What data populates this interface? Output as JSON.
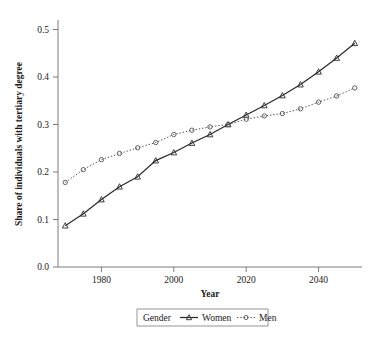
{
  "chart_data": {
    "type": "line",
    "title": "",
    "xlabel": "Year",
    "ylabel": "Share of individuals with tertiary degree",
    "xlim": [
      1968,
      2052
    ],
    "ylim": [
      0.0,
      0.52
    ],
    "xticks": [
      1980,
      2000,
      2020,
      2040
    ],
    "xticklabels": [
      "1980",
      "2000",
      "2020",
      "2040"
    ],
    "yticks": [
      0.0,
      0.1,
      0.2,
      0.3,
      0.4,
      0.5
    ],
    "yticklabels": [
      "0.0",
      "0.1",
      "0.2",
      "0.3",
      "0.4",
      "0.5"
    ],
    "grid": false,
    "legend_position": "bottom-outside",
    "legend_title": "Gender",
    "x": [
      1970,
      1975,
      1980,
      1985,
      1990,
      1995,
      2000,
      2005,
      2010,
      2015,
      2020,
      2025,
      2030,
      2035,
      2040,
      2045,
      2050
    ],
    "series": [
      {
        "name": "Women",
        "marker": "triangle",
        "linestyle": "solid",
        "color": "#2b2b2b",
        "values": [
          0.087,
          0.112,
          0.142,
          0.169,
          0.19,
          0.224,
          0.241,
          0.261,
          0.279,
          0.3,
          0.32,
          0.34,
          0.361,
          0.384,
          0.411,
          0.44,
          0.471
        ]
      },
      {
        "name": "Men",
        "marker": "circle",
        "linestyle": "dotted",
        "color": "#555555",
        "values": [
          0.178,
          0.205,
          0.226,
          0.239,
          0.251,
          0.262,
          0.279,
          0.288,
          0.295,
          0.3,
          0.311,
          0.318,
          0.323,
          0.333,
          0.347,
          0.36,
          0.377
        ]
      }
    ]
  },
  "axis": {
    "x_title": "Year",
    "y_title": "Share of individuals with tertiary degree"
  },
  "legend": {
    "title": "Gender",
    "entries": [
      {
        "label": "Women",
        "marker": "triangle-marker",
        "style": "solid"
      },
      {
        "label": "Men",
        "marker": "circle-marker",
        "style": "dotted"
      }
    ]
  }
}
